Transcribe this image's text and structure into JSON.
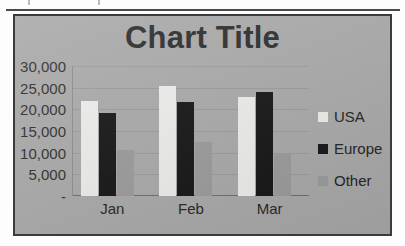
{
  "chart_data": {
    "type": "bar",
    "title": "Chart Title",
    "xlabel": "",
    "ylabel": "",
    "categories": [
      "Jan",
      "Feb",
      "Mar"
    ],
    "series": [
      {
        "name": "USA",
        "color": "#ededeb",
        "values": [
          22000,
          25500,
          22800
        ]
      },
      {
        "name": "Europe",
        "color": "#141414",
        "values": [
          19200,
          21700,
          24000
        ]
      },
      {
        "name": "Other",
        "color": "#9b9b9b",
        "values": [
          10600,
          12400,
          9600
        ]
      }
    ],
    "ylim": [
      0,
      30000
    ],
    "ytick_values": [
      30000,
      25000,
      20000,
      15000,
      10000,
      5000,
      0
    ],
    "ytick_labels": [
      "30,000",
      "25,000",
      "20,000",
      "15,000",
      "10,000",
      "5,000",
      "-"
    ],
    "grid": true,
    "legend_position": "right"
  },
  "legend": {
    "items": [
      {
        "label": "USA"
      },
      {
        "label": "Europe"
      },
      {
        "label": "Other"
      }
    ]
  }
}
